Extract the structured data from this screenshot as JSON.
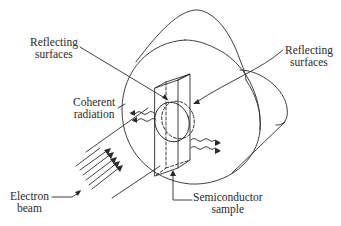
{
  "diagram": {
    "type": "electron-beam pumped semiconductor laser schematic",
    "labels": {
      "reflecting_left": {
        "line1": "Reflecting",
        "line2": "surfaces"
      },
      "reflecting_right": {
        "line1": "Reflecting",
        "line2": "surfaces"
      },
      "coherent": {
        "line1": "Coherent",
        "line2": "radiation"
      },
      "electron": {
        "line1": "Electron",
        "line2": "beam"
      },
      "semiconductor": {
        "line1": "Semiconductor",
        "line2": "sample"
      }
    },
    "colors": {
      "line": "#2a2a2a",
      "background": "#ffffff"
    }
  }
}
